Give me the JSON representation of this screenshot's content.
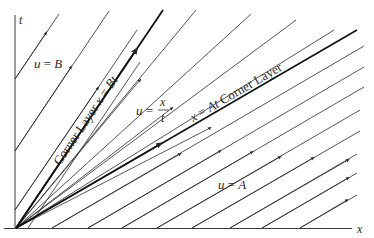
{
  "figure": {
    "type": "characteristics-diagram",
    "axes": {
      "x_label": "x",
      "t_label": "t",
      "origin": [
        16,
        228
      ]
    },
    "regions": {
      "left": {
        "label": "u = B"
      },
      "fan": {
        "label_lhs": "u =",
        "label_num": "x",
        "label_den": "t"
      },
      "right": {
        "label": "u = A"
      }
    },
    "boundaries": {
      "upper": {
        "label": "Corner Layer  x = Bt",
        "equation": "x = Bt",
        "end": [
          163,
          10
        ]
      },
      "lower": {
        "label": "x = At  Corner Layer",
        "equation": "x = At",
        "end": [
          357,
          30
        ]
      }
    },
    "line_color": "#2a2a2a",
    "background": "#ffffff"
  }
}
